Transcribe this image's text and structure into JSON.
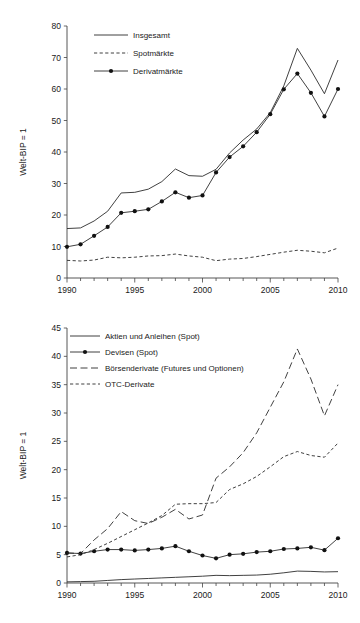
{
  "figure_top": {
    "ylabel": "Welt-BIP = 1",
    "y_ticks": [
      "0",
      "10",
      "20",
      "30",
      "40",
      "50",
      "60",
      "70",
      "80"
    ],
    "x_ticks": [
      "1990",
      "1995",
      "2000",
      "2005",
      "2010"
    ],
    "legend": [
      {
        "label": "Insgesamt",
        "style": "solid"
      },
      {
        "label": "Spotmärkte",
        "style": "dashed"
      },
      {
        "label": "Derivatmärkte",
        "style": "solid-markers"
      }
    ],
    "chart_data": {
      "type": "line",
      "title": "",
      "xlabel": "",
      "ylabel": "Welt-BIP = 1",
      "xlim": [
        1990,
        2010
      ],
      "ylim": [
        0,
        80
      ],
      "grid": false,
      "legend_position": "top-left",
      "x": [
        1990,
        1991,
        1992,
        1993,
        1994,
        1995,
        1996,
        1997,
        1998,
        1999,
        2000,
        2001,
        2002,
        2003,
        2004,
        2005,
        2006,
        2007,
        2008,
        2009,
        2010
      ],
      "series": [
        {
          "name": "Insgesamt",
          "style": "solid",
          "values": [
            15.7,
            15.9,
            18.1,
            21.2,
            27.0,
            27.2,
            28.2,
            30.6,
            34.6,
            32.5,
            32.3,
            34.5,
            39.7,
            43.8,
            47.3,
            52.5,
            61.0,
            72.9,
            66.0,
            58.5,
            69.2
          ]
        },
        {
          "name": "Spotmärkte",
          "style": "dashed",
          "values": [
            5.6,
            5.4,
            5.7,
            6.6,
            6.4,
            6.6,
            7.0,
            7.1,
            7.6,
            7.0,
            6.6,
            5.5,
            6.0,
            6.2,
            6.8,
            7.5,
            8.2,
            8.8,
            8.5,
            8.0,
            9.5
          ]
        },
        {
          "name": "Derivatmärkte",
          "style": "solid-markers",
          "values": [
            9.9,
            10.7,
            13.4,
            16.2,
            20.7,
            21.2,
            21.8,
            24.3,
            27.2,
            25.5,
            26.2,
            33.5,
            38.4,
            41.8,
            46.3,
            52.0,
            59.9,
            64.9,
            58.8,
            51.3,
            60.0
          ]
        }
      ]
    }
  },
  "figure_bottom": {
    "ylabel": "Welt-BIP = 1",
    "y_ticks": [
      "0",
      "5",
      "10",
      "15",
      "20",
      "25",
      "30",
      "35",
      "40",
      "45"
    ],
    "x_ticks": [
      "1990",
      "1995",
      "2000",
      "2005",
      "2010"
    ],
    "legend": [
      {
        "label": "Aktien und Anleihen (Spot)",
        "style": "solid"
      },
      {
        "label": "Devisen (Spot)",
        "style": "solid-markers"
      },
      {
        "label": "Börsenderivate (Futures und Optionen)",
        "style": "longdash"
      },
      {
        "label": "OTC-Derivate",
        "style": "dashed"
      }
    ],
    "chart_data": {
      "type": "line",
      "title": "",
      "xlabel": "",
      "ylabel": "Welt-BIP = 1",
      "xlim": [
        1990,
        2010
      ],
      "ylim": [
        0,
        45
      ],
      "grid": false,
      "legend_position": "top-left",
      "x": [
        1990,
        1991,
        1992,
        1993,
        1994,
        1995,
        1996,
        1997,
        1998,
        1999,
        2000,
        2001,
        2002,
        2003,
        2004,
        2005,
        2006,
        2007,
        2008,
        2009,
        2010
      ],
      "series": [
        {
          "name": "Aktien und Anleihen (Spot)",
          "style": "solid",
          "values": [
            0.2,
            0.25,
            0.3,
            0.45,
            0.6,
            0.7,
            0.8,
            0.9,
            1.0,
            1.1,
            1.2,
            1.35,
            1.3,
            1.35,
            1.4,
            1.55,
            1.8,
            2.1,
            2.05,
            1.95,
            2.0
          ]
        },
        {
          "name": "Devisen (Spot)",
          "style": "solid-markers",
          "values": [
            5.3,
            5.2,
            5.6,
            5.9,
            5.9,
            5.75,
            5.9,
            6.1,
            6.5,
            5.6,
            4.85,
            4.35,
            5.0,
            5.15,
            5.45,
            5.6,
            6.0,
            6.1,
            6.3,
            5.8,
            7.9
          ]
        },
        {
          "name": "Börsenderivate (Futures und Optionen)",
          "style": "longdash",
          "values": [
            5.3,
            5.2,
            7.6,
            9.6,
            12.6,
            11.0,
            10.5,
            11.6,
            13.0,
            11.3,
            12.0,
            18.5,
            20.5,
            23.0,
            26.5,
            31.0,
            35.5,
            41.3,
            36.0,
            29.5,
            35.0
          ]
        },
        {
          "name": "OTC-Derivate",
          "style": "dashed",
          "values": [
            4.6,
            5.0,
            5.9,
            7.0,
            8.2,
            9.4,
            10.6,
            11.9,
            13.9,
            14.0,
            14.0,
            14.2,
            16.5,
            17.5,
            18.8,
            20.5,
            22.3,
            23.2,
            22.5,
            22.2,
            24.7
          ]
        }
      ]
    }
  }
}
